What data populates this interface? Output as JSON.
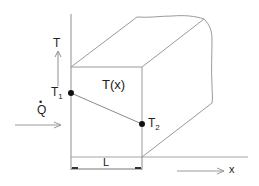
{
  "diagram": {
    "title": "",
    "colors": {
      "line": "#9a9a9a",
      "dark_line": "#555555",
      "dot": "#111111",
      "text": "#222222"
    },
    "labels": {
      "T_axis": "T",
      "T1_main": "T",
      "T1_sub": "1",
      "T2_main": "T",
      "T2_sub": "2",
      "Tx": "T(x)",
      "Q": "Q",
      "Q_dot": "•",
      "L": "L",
      "x_axis": "x"
    },
    "nodes": [
      {
        "id": "T1",
        "label": "T1",
        "x": 71,
        "y": 93
      },
      {
        "id": "T2",
        "label": "T2",
        "x": 142,
        "y": 124
      }
    ],
    "edges": [
      {
        "from": "T1",
        "to": "T2",
        "meaning": "linear temperature profile T(x)"
      }
    ]
  }
}
